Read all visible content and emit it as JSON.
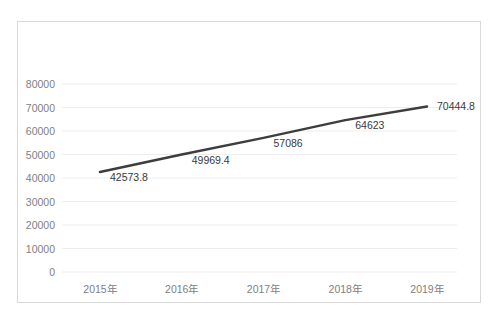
{
  "chart_data": {
    "type": "line",
    "title": "",
    "subtitle": "",
    "xlabel": "",
    "ylabel": "",
    "categories": [
      "2015年",
      "2016年",
      "2017年",
      "2018年",
      "2019年"
    ],
    "values": [
      42573.8,
      49969.4,
      57086,
      64623,
      70444.8
    ],
    "point_labels": [
      "42573.8",
      "49969.4",
      "57086",
      "64623",
      "70444.8"
    ],
    "series": [
      {
        "name": "",
        "values": [
          42573.8,
          49969.4,
          57086,
          64623,
          70444.8
        ],
        "color": "#3d3d3d",
        "line_width": 2.5,
        "markers": false
      }
    ],
    "ylim": [
      0,
      80000
    ],
    "ytick_step": 10000,
    "ytick_labels": [
      "80000",
      "70000",
      "60000",
      "50000",
      "40000",
      "30000",
      "20000",
      "10000",
      "0"
    ],
    "ytick_values": [
      80000,
      70000,
      60000,
      50000,
      40000,
      30000,
      20000,
      10000,
      0
    ],
    "grid": {
      "horizontal": true,
      "vertical": false,
      "color": "#ededed"
    },
    "legend": {
      "visible": false,
      "position": "none",
      "entries": []
    },
    "colors": {
      "line": "#3d3d3d",
      "axis_text": "#808080",
      "data_label_text": "#3a3a3a",
      "gridline": "#ededed",
      "frame_border": "#d9d9d9",
      "background": "#ffffff"
    }
  }
}
